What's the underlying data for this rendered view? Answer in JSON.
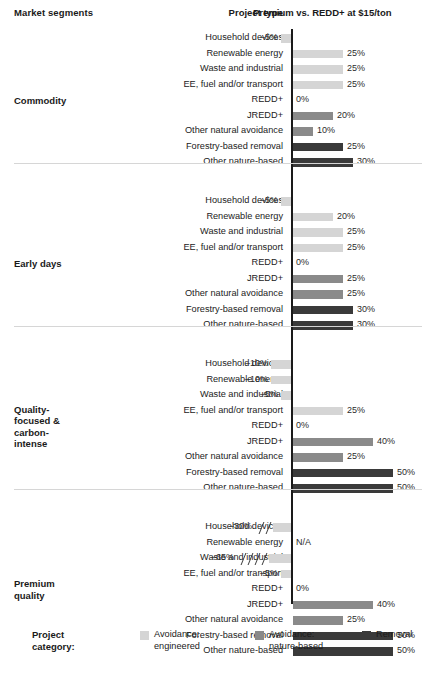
{
  "header": {
    "market_segments": "Market segments",
    "project_type": "Project type",
    "premium": "Premium vs. REDD+ at $15/ton"
  },
  "legend": {
    "title_line1": "Project",
    "title_line2": "category:",
    "items": [
      {
        "label_line1": "Avoidance:",
        "label_line2": "engineered",
        "color": "#d5d5d5"
      },
      {
        "label_line1": "Avoidance:",
        "label_line2": "nature-based",
        "color": "#8a8a8a"
      },
      {
        "label_line1": "Removal",
        "label_line2": "",
        "color": "#3a3a3a"
      }
    ]
  },
  "axis": {
    "zero_label_bottom": "0%",
    "na_label": "N/A"
  },
  "chart_data": {
    "type": "bar",
    "title": "Premium vs. REDD+ at $15/ton",
    "xlabel": "Premium vs. REDD+ at $15/ton",
    "ylabel": "Project type",
    "orientation": "horizontal",
    "grid": false,
    "legend_position": "bottom",
    "value_unit": "%",
    "categories": [
      "Household devices",
      "Renewable energy",
      "Waste and industrial",
      "EE, fuel and/or transport",
      "REDD+",
      "JREDD+",
      "Other natural avoidance",
      "Forestry-based removal",
      "Other nature-based"
    ],
    "project_category_by_type": [
      "Avoidance: engineered",
      "Avoidance: engineered",
      "Avoidance: engineered",
      "Avoidance: engineered",
      "Avoidance: nature-based",
      "Avoidance: nature-based",
      "Avoidance: nature-based",
      "Removal",
      "Removal"
    ],
    "series": [
      {
        "name": "Commodity",
        "values": [
          -5,
          25,
          25,
          25,
          0,
          20,
          10,
          25,
          30
        ],
        "labels": [
          "–5%",
          "25%",
          "25%",
          "25%",
          "0%",
          "20%",
          "10%",
          "25%",
          "30%"
        ]
      },
      {
        "name": "Early days",
        "values": [
          -5,
          20,
          25,
          25,
          0,
          25,
          25,
          30,
          30
        ],
        "labels": [
          "–5%",
          "20%",
          "25%",
          "25%",
          "0%",
          "25%",
          "25%",
          "30%",
          "30%"
        ]
      },
      {
        "name": "Quality-focused & carbon-intense",
        "values": [
          -10,
          -10,
          -5,
          25,
          0,
          40,
          25,
          50,
          50
        ],
        "labels": [
          "–10%",
          "–10%",
          "–5%",
          "25%",
          "0%",
          "40%",
          "25%",
          "50%",
          "50%"
        ]
      },
      {
        "name": "Premium quality",
        "values": [
          -30,
          null,
          -65,
          -5,
          0,
          40,
          25,
          50,
          50
        ],
        "labels": [
          "–30%",
          "N/A",
          "–65%",
          "–5%",
          "0%",
          "40%",
          "25%",
          "50%",
          "50%"
        ]
      }
    ],
    "axis_note_bottom": "0%"
  },
  "sections": [
    {
      "segment_label": "Commodity",
      "segment_lines": [
        "Commodity"
      ],
      "rows": [
        {
          "type": "Household devices",
          "label": "–5%",
          "value": -5,
          "color": "#d5d5d5",
          "breaks": 0
        },
        {
          "type": "Renewable energy",
          "label": "25%",
          "value": 25,
          "color": "#d5d5d5",
          "breaks": 0
        },
        {
          "type": "Waste and industrial",
          "label": "25%",
          "value": 25,
          "color": "#d5d5d5",
          "breaks": 0
        },
        {
          "type": "EE, fuel and/or transport",
          "label": "25%",
          "value": 25,
          "color": "#d5d5d5",
          "breaks": 0
        },
        {
          "type": "REDD+",
          "label": "0%",
          "value": 0,
          "color": "#8a8a8a",
          "breaks": 0
        },
        {
          "type": "JREDD+",
          "label": "20%",
          "value": 20,
          "color": "#8a8a8a",
          "breaks": 0
        },
        {
          "type": "Other natural avoidance",
          "label": "10%",
          "value": 10,
          "color": "#8a8a8a",
          "breaks": 0
        },
        {
          "type": "Forestry-based removal",
          "label": "25%",
          "value": 25,
          "color": "#3a3a3a",
          "breaks": 0
        },
        {
          "type": "Other nature-based",
          "label": "30%",
          "value": 30,
          "color": "#3a3a3a",
          "breaks": 0
        }
      ]
    },
    {
      "segment_label": "Early days",
      "segment_lines": [
        "Early days"
      ],
      "rows": [
        {
          "type": "Household devices",
          "label": "–5%",
          "value": -5,
          "color": "#d5d5d5",
          "breaks": 0
        },
        {
          "type": "Renewable energy",
          "label": "20%",
          "value": 20,
          "color": "#d5d5d5",
          "breaks": 0
        },
        {
          "type": "Waste and industrial",
          "label": "25%",
          "value": 25,
          "color": "#d5d5d5",
          "breaks": 0
        },
        {
          "type": "EE, fuel and/or transport",
          "label": "25%",
          "value": 25,
          "color": "#d5d5d5",
          "breaks": 0
        },
        {
          "type": "REDD+",
          "label": "0%",
          "value": 0,
          "color": "#8a8a8a",
          "breaks": 0
        },
        {
          "type": "JREDD+",
          "label": "25%",
          "value": 25,
          "color": "#8a8a8a",
          "breaks": 0
        },
        {
          "type": "Other natural avoidance",
          "label": "25%",
          "value": 25,
          "color": "#8a8a8a",
          "breaks": 0
        },
        {
          "type": "Forestry-based removal",
          "label": "30%",
          "value": 30,
          "color": "#3a3a3a",
          "breaks": 0
        },
        {
          "type": "Other nature-based",
          "label": "30%",
          "value": 30,
          "color": "#3a3a3a",
          "breaks": 0
        }
      ]
    },
    {
      "segment_label": "Quality-focused & carbon-intense",
      "segment_lines": [
        "Quality-",
        "focused &",
        "carbon-",
        "intense"
      ],
      "rows": [
        {
          "type": "Household devices",
          "label": "–10%",
          "value": -10,
          "color": "#d5d5d5",
          "breaks": 0
        },
        {
          "type": "Renewable energy",
          "label": "–10%",
          "value": -10,
          "color": "#d5d5d5",
          "breaks": 0
        },
        {
          "type": "Waste and industrial",
          "label": "–5%",
          "value": -5,
          "color": "#d5d5d5",
          "breaks": 0
        },
        {
          "type": "EE, fuel and/or transport",
          "label": "25%",
          "value": 25,
          "color": "#d5d5d5",
          "breaks": 0
        },
        {
          "type": "REDD+",
          "label": "0%",
          "value": 0,
          "color": "#8a8a8a",
          "breaks": 0
        },
        {
          "type": "JREDD+",
          "label": "40%",
          "value": 40,
          "color": "#8a8a8a",
          "breaks": 0
        },
        {
          "type": "Other natural avoidance",
          "label": "25%",
          "value": 25,
          "color": "#8a8a8a",
          "breaks": 0
        },
        {
          "type": "Forestry-based removal",
          "label": "50%",
          "value": 50,
          "color": "#3a3a3a",
          "breaks": 0
        },
        {
          "type": "Other nature-based",
          "label": "50%",
          "value": 50,
          "color": "#3a3a3a",
          "breaks": 0
        }
      ]
    },
    {
      "segment_label": "Premium quality",
      "segment_lines": [
        "Premium",
        "quality"
      ],
      "rows": [
        {
          "type": "Household devices",
          "label": "–30%",
          "value": -30,
          "color": "#d5d5d5",
          "breaks": 2
        },
        {
          "type": "Renewable energy",
          "label": "N/A",
          "value": null,
          "color": "#d5d5d5",
          "breaks": 0
        },
        {
          "type": "Waste and industrial",
          "label": "–65%",
          "value": -65,
          "color": "#d5d5d5",
          "breaks": 4
        },
        {
          "type": "EE, fuel and/or transport",
          "label": "–5%",
          "value": -5,
          "color": "#d5d5d5",
          "breaks": 0
        },
        {
          "type": "REDD+",
          "label": "0%",
          "value": 0,
          "color": "#8a8a8a",
          "breaks": 0
        },
        {
          "type": "JREDD+",
          "label": "40%",
          "value": 40,
          "color": "#8a8a8a",
          "breaks": 0
        },
        {
          "type": "Other natural avoidance",
          "label": "25%",
          "value": 25,
          "color": "#8a8a8a",
          "breaks": 0
        },
        {
          "type": "Forestry-based removal",
          "label": "50%",
          "value": 50,
          "color": "#3a3a3a",
          "breaks": 0
        },
        {
          "type": "Other nature-based",
          "label": "50%",
          "value": 50,
          "color": "#3a3a3a",
          "breaks": 0
        }
      ]
    }
  ]
}
